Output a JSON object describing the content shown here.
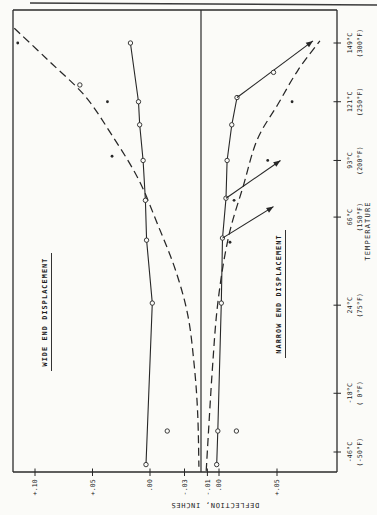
{
  "figure": {
    "kind": "scanned-two-panel-line-chart",
    "paper_color": "#fbfbf8",
    "ink_color": "#272727",
    "rotation": "figure printed rotated 90 degrees counterclockwise on page"
  },
  "chart_data": {
    "type": "line",
    "xlabel": "TEMPERATURE",
    "ylabel": "DEFLECTION, INCHES",
    "x_unit": "degC",
    "xlim": [
      -60,
      160
    ],
    "grid": false,
    "legend": "none",
    "x_ticks": [
      {
        "T": -46,
        "line1": "-46°C",
        "line2": "(-50°F)"
      },
      {
        "T": -18,
        "line1": "-18°C",
        "line2": "( 0°F)"
      },
      {
        "T": 24,
        "line1": "24°C",
        "line2": "(75°F)"
      },
      {
        "T": 66,
        "line1": "66°C",
        "line2": "(150°F)"
      },
      {
        "T": 93,
        "line1": "93°C",
        "line2": "(200°F)"
      },
      {
        "T": 121,
        "line1": "121°C",
        "line2": "(250°F)"
      },
      {
        "T": 149,
        "line1": "149°C",
        "line2": "(300°F)"
      }
    ],
    "panels": [
      {
        "id": "wide",
        "title": "WIDE END DISPLACEMENT",
        "y_direction": "positive-up",
        "y_ticks": [
          {
            "label": "+.10",
            "v": 0.1
          },
          {
            "label": "+.05",
            "v": 0.05
          },
          {
            "label": ".00",
            "v": 0.0
          },
          {
            "label": "-.03",
            "v": -0.03
          }
        ],
        "series": [
          {
            "name": "predicted-deflection-curve",
            "line": "dashed",
            "smooth": true,
            "arrow_end": false,
            "points": [
              [
                156,
                0.118
              ],
              [
                141,
                0.089
              ],
              [
                124,
                0.057
              ],
              [
                105,
                0.033
              ],
              [
                84,
                0.01
              ],
              [
                62,
                -0.007
              ],
              [
                41,
                -0.022
              ],
              [
                19,
                -0.033
              ],
              [
                -5,
                -0.0385
              ],
              [
                -28,
                -0.0415
              ],
              [
                -53,
                -0.0425
              ]
            ],
            "circles": [
              [
                129,
                0.061
              ]
            ],
            "dots": []
          },
          {
            "name": "measured-deflection-line",
            "line": "solid",
            "smooth": false,
            "arrow_end": false,
            "points": [
              [
                -52,
                0.0035
              ],
              [
                25,
                -0.002
              ],
              [
                55,
                0.003
              ],
              [
                74,
                0.004
              ],
              [
                93,
                0.006
              ],
              [
                110,
                0.009
              ],
              [
                121,
                0.01
              ],
              [
                149,
                0.017
              ]
            ],
            "circles": [
              [
                -52,
                0.0035
              ],
              [
                25,
                -0.002
              ],
              [
                55,
                0.003
              ],
              [
                74,
                0.004
              ],
              [
                93,
                0.006
              ],
              [
                110,
                0.009
              ],
              [
                121,
                0.01
              ],
              [
                149,
                0.017
              ]
            ],
            "dots": []
          },
          {
            "name": "scatter-points",
            "line": "none",
            "smooth": false,
            "arrow_end": false,
            "points": [],
            "circles": [
              [
                -36,
                -0.015
              ]
            ],
            "dots": [
              [
                149,
                0.115
              ],
              [
                121,
                0.037
              ],
              [
                95,
                0.033
              ]
            ]
          }
        ]
      },
      {
        "id": "narrow",
        "title": "NARROW END DISPLACEMENT",
        "y_direction": "positive-down",
        "y_ticks": [
          {
            "label": "-.01",
            "v": -0.01
          },
          {
            "label": ".00",
            "v": 0.0
          },
          {
            "label": "+.05",
            "v": 0.05
          }
        ],
        "series": [
          {
            "name": "predicted-deflection-curve",
            "line": "dashed",
            "smooth": true,
            "arrow_end": false,
            "points": [
              [
                -55,
                -0.011
              ],
              [
                -9,
                -0.006
              ],
              [
                25,
                -0.001
              ],
              [
                56,
                0.008
              ],
              [
                81,
                0.021
              ],
              [
                103,
                0.033
              ],
              [
                120,
                0.051
              ],
              [
                136,
                0.068
              ],
              [
                150,
                0.087
              ]
            ],
            "circles": [],
            "dots": []
          },
          {
            "name": "measured-deflection-line",
            "line": "solid",
            "smooth": false,
            "arrow_end": false,
            "points": [
              [
                -52,
                -0.002
              ],
              [
                -36,
                -0.001
              ],
              [
                25,
                0.002
              ],
              [
                56,
                0.003
              ],
              [
                75,
                0.006
              ],
              [
                93,
                0.007
              ],
              [
                110,
                0.011
              ],
              [
                123,
                0.0155
              ]
            ],
            "circles": [
              [
                -52,
                -0.002
              ],
              [
                -36,
                -0.001
              ],
              [
                25,
                0.002
              ],
              [
                56,
                0.003
              ],
              [
                75,
                0.006
              ],
              [
                93,
                0.007
              ],
              [
                110,
                0.011
              ],
              [
                123,
                0.0155
              ]
            ],
            "dots": []
          },
          {
            "name": "trend-line-to-149c",
            "line": "solid",
            "smooth": false,
            "arrow_end": true,
            "points": [
              [
                123,
                0.0155
              ],
              [
                150,
                0.081
              ]
            ],
            "circles": [
              [
                135,
                0.047
              ]
            ],
            "dots": []
          },
          {
            "name": "trend-line-to-93c",
            "line": "solid",
            "smooth": false,
            "arrow_end": true,
            "points": [
              [
                75,
                0.006
              ],
              [
                93,
                0.053
              ]
            ],
            "circles": [],
            "dots": []
          },
          {
            "name": "trend-line-to-71c",
            "line": "solid",
            "smooth": false,
            "arrow_end": true,
            "points": [
              [
                56,
                0.003
              ],
              [
                71,
                0.047
              ]
            ],
            "circles": [],
            "dots": []
          },
          {
            "name": "scatter-points",
            "line": "none",
            "smooth": false,
            "arrow_end": false,
            "points": [],
            "circles": [
              [
                -36,
                0.015
              ]
            ],
            "dots": [
              [
                121,
                0.063
              ],
              [
                93,
                0.042
              ],
              [
                74,
                0.013
              ],
              [
                54,
                0.0095
              ]
            ]
          }
        ]
      }
    ]
  }
}
